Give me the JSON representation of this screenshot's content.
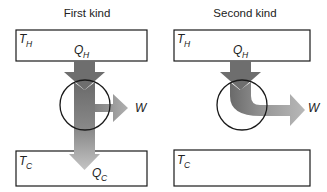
{
  "panels": [
    {
      "title": "First kind",
      "hot_reservoir": {
        "symbol": "T",
        "subscript": "H"
      },
      "cold_reservoir": {
        "symbol": "T",
        "subscript": "C"
      },
      "heat_in": {
        "symbol": "Q",
        "subscript": "H"
      },
      "work_out": {
        "symbol": "W"
      },
      "heat_out": {
        "symbol": "Q",
        "subscript": "C"
      }
    },
    {
      "title": "Second kind",
      "hot_reservoir": {
        "symbol": "T",
        "subscript": "H"
      },
      "cold_reservoir": {
        "symbol": "T",
        "subscript": "C"
      },
      "heat_in": {
        "symbol": "Q",
        "subscript": "H"
      },
      "work_out": {
        "symbol": "W"
      }
    }
  ],
  "colors": {
    "arrow_dark": "#6e6e6e",
    "arrow_mid": "#8c8c8c",
    "arrow_light": "#b4b4b4",
    "outline": "#1a1a1a"
  }
}
